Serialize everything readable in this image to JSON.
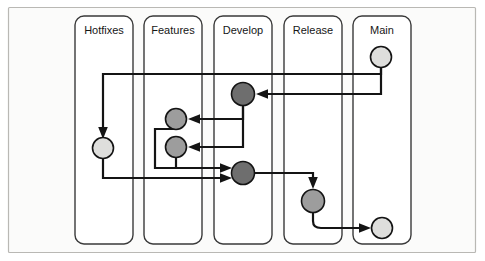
{
  "diagram": {
    "type": "swimlane-flow",
    "canvas": {
      "width": 485,
      "height": 261
    },
    "frame": {
      "x": 8,
      "y": 7,
      "width": 468,
      "height": 246,
      "fill": "#fbfbfa",
      "stroke": "#b9b8b4"
    },
    "colors": {
      "line": "#141414",
      "lane_stroke": "#3a3a3a",
      "lane_fill": "#ffffff",
      "node_light": "#dededc",
      "node_medium": "#9d9d9d",
      "node_dark": "#6e6e6e",
      "label_text": "#161616",
      "page_background": "#ffffff"
    },
    "lanes": [
      {
        "id": "hotfixes",
        "label": "Hotfixes",
        "x": 75,
        "y": 16,
        "width": 58,
        "height": 228,
        "label_x": 104,
        "label_y": 31
      },
      {
        "id": "features",
        "label": "Features",
        "x": 144,
        "y": 16,
        "width": 58,
        "height": 228,
        "label_x": 173,
        "label_y": 31
      },
      {
        "id": "develop",
        "label": "Develop",
        "x": 214,
        "y": 16,
        "width": 58,
        "height": 228,
        "label_x": 243,
        "label_y": 31
      },
      {
        "id": "release",
        "label": "Release",
        "x": 284,
        "y": 16,
        "width": 58,
        "height": 228,
        "label_x": 313,
        "label_y": 31
      },
      {
        "id": "main",
        "label": "Main",
        "x": 353,
        "y": 16,
        "width": 58,
        "height": 228,
        "label_x": 382,
        "label_y": 31
      }
    ],
    "nodes": [
      {
        "id": "main-top",
        "lane": "main",
        "cx": 381,
        "cy": 57,
        "r": 10.5,
        "shade": "light"
      },
      {
        "id": "develop-top",
        "lane": "develop",
        "cx": 243,
        "cy": 94,
        "r": 11.5,
        "shade": "dark"
      },
      {
        "id": "feature-1",
        "lane": "features",
        "cx": 176,
        "cy": 119,
        "r": 10.5,
        "shade": "medium"
      },
      {
        "id": "hotfix-1",
        "lane": "hotfixes",
        "cx": 103,
        "cy": 148,
        "r": 10.5,
        "shade": "light"
      },
      {
        "id": "feature-2",
        "lane": "features",
        "cx": 176,
        "cy": 147,
        "r": 10.5,
        "shade": "medium"
      },
      {
        "id": "develop-bot",
        "lane": "develop",
        "cx": 243,
        "cy": 173,
        "r": 11.5,
        "shade": "dark"
      },
      {
        "id": "release-1",
        "lane": "release",
        "cx": 313,
        "cy": 201,
        "r": 11.5,
        "shade": "medium"
      },
      {
        "id": "main-bot",
        "lane": "main",
        "cx": 382,
        "cy": 228,
        "r": 10.5,
        "shade": "light"
      }
    ],
    "connectors": [
      {
        "id": "main-to-hotfix",
        "from": "main-top",
        "to": "hotfix-1",
        "path": "M 381 67.5 L 381 74 L 103 74 L 103 133",
        "arrow": "down"
      },
      {
        "id": "main-to-develop",
        "from": "main-top",
        "to": "develop-top",
        "path": "M 381 67.5 L 381 94 L 259 94",
        "arrow": "left"
      },
      {
        "id": "develop-to-feature1",
        "from": "develop-top",
        "to": "feature-1",
        "path": "M 243 105.5 L 243 119 L 191 119",
        "arrow": "left"
      },
      {
        "id": "develop-to-feature2",
        "from": "develop-top",
        "to": "feature-2",
        "path": "M 243 105.5 L 243 147 L 191 147",
        "arrow": "left"
      },
      {
        "id": "feature1-merge",
        "from": "feature-1",
        "to": "develop-bot",
        "path": "M 176 129.5 L 155 129.5 L 155 168 L 228 168",
        "arrow": "right"
      },
      {
        "id": "feature2-merge",
        "from": "feature-2",
        "to": "develop-bot",
        "path": "M 176 157.5 L 176 168 L 228 168",
        "arrow": "right"
      },
      {
        "id": "hotfix-merge",
        "from": "hotfix-1",
        "to": "develop-bot",
        "path": "M 103 158.5 L 103 178 L 228 178",
        "arrow": "right"
      },
      {
        "id": "develop-to-release",
        "from": "develop-bot",
        "to": "release-1",
        "path": "M 254.5 173 L 313 173 L 313 186",
        "arrow": "down"
      },
      {
        "id": "release-to-main",
        "from": "release-1",
        "to": "main-bot",
        "path": "M 313 212.5 L 313 222 Q 313 228 321 228 L 367 228",
        "arrow": "right"
      }
    ]
  }
}
